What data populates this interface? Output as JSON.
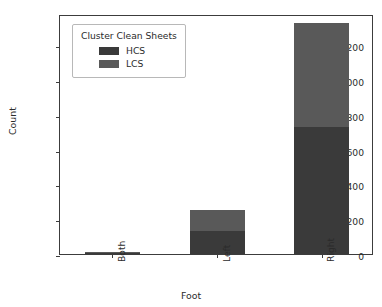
{
  "chart_data": {
    "type": "bar",
    "subtype": "stacked-vertical",
    "title": "",
    "xlabel": "Foot",
    "ylabel": "Count",
    "categories": [
      "Both",
      "Left",
      "Right"
    ],
    "series": [
      {
        "name": "HCS",
        "color": "#3a3a3a",
        "values": [
          8,
          133,
          730
        ]
      },
      {
        "name": "LCS",
        "color": "#595959",
        "values": [
          4,
          122,
          598
        ]
      }
    ],
    "totals": [
      12,
      255,
      1328
    ],
    "ylim": [
      0,
      1380
    ],
    "yticks": [
      0,
      200,
      400,
      600,
      800,
      1000,
      1200
    ],
    "ytick_labels": [
      "0",
      "200",
      "400",
      "600",
      "800",
      "1000",
      "1200"
    ],
    "xtick_labels": [
      "Both",
      "Left",
      "Right"
    ],
    "xtick_rotation": 90,
    "grid": false,
    "legend": {
      "title": "Cluster Clean Sheets",
      "position": "upper-left-inside",
      "entries": [
        {
          "label": "HCS",
          "color": "#3a3a3a"
        },
        {
          "label": "LCS",
          "color": "#595959"
        }
      ]
    },
    "axis_color": "#3c3c3c",
    "background": "#ffffff"
  }
}
